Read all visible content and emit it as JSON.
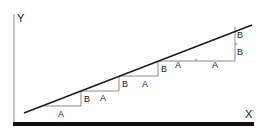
{
  "diagram": {
    "type": "staircase-slope",
    "axes": {
      "x_label": "X",
      "y_label": "Y"
    },
    "colors": {
      "line": "#1a1a1a",
      "steps": "#8a8a8a",
      "y_axis": "#b0b0b0",
      "x_axis": "#111111",
      "text": "#222222"
    },
    "steps": [
      {
        "run_label": "A",
        "rise_label": "B"
      },
      {
        "run_label": "A",
        "rise_label": "B"
      },
      {
        "run_label": "A",
        "rise_label": "B"
      },
      {
        "run_labels": [
          "A",
          "A"
        ],
        "rise_labels": [
          "B",
          "B"
        ]
      }
    ],
    "labels": {
      "step1_run": "A",
      "step1_rise": "B",
      "step2_run": "A",
      "step2_rise": "B",
      "step3_run": "A",
      "step3_rise": "B",
      "step4_run_a": "A",
      "step4_run_b": "A",
      "step4_rise_a": "B",
      "step4_rise_b": "B"
    }
  }
}
